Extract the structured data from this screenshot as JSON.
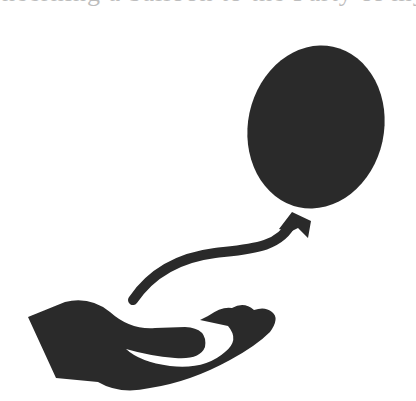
{
  "header": {
    "clipped_text": "neerning a balloon to the Party of my frie"
  },
  "illustration": {
    "subject": "hand releasing a balloon",
    "icons": [
      "balloon-icon",
      "balloon-string-icon",
      "open-hand-icon"
    ],
    "fill_color": "#2a2a2a",
    "background_color": "#ffffff"
  }
}
